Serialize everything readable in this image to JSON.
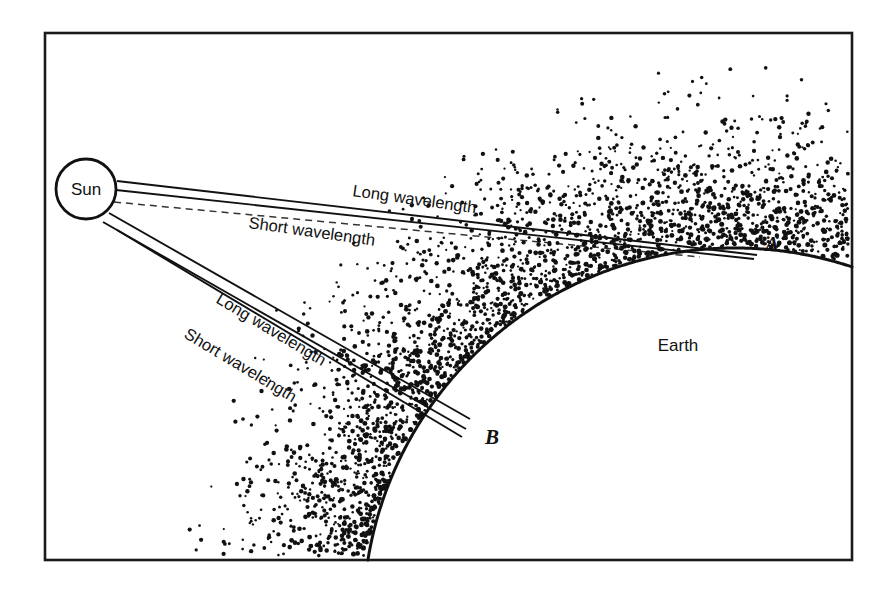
{
  "figure": {
    "name": "solar-radiation-atmosphere-diagram",
    "caption_visible": false,
    "background_color": "#ffffff",
    "ink_color": "#111111",
    "frame": {
      "x": 45,
      "y": 33,
      "width": 807,
      "height": 527
    }
  },
  "labels": {
    "sun": "Sun",
    "earth": "Earth",
    "point_a": "A",
    "point_b": "B",
    "upper_long": "Long wavelength",
    "upper_short": "Short wavelength",
    "lower_long": "Long wavelength",
    "lower_short": "Short wavelength"
  },
  "chart_data": {
    "type": "diagram",
    "title": "",
    "subtitle": "",
    "xlabel": "",
    "ylabel": "",
    "grid": false,
    "legend": "none",
    "bodies": [
      {
        "name": "sun",
        "shape": "circle",
        "label": "Sun",
        "cx": 86,
        "cy": 189,
        "r": 30
      },
      {
        "name": "earth",
        "shape": "arc",
        "label": "Earth",
        "cx": 735,
        "cy": 620,
        "r": 372,
        "label_x": 678,
        "label_y": 351
      }
    ],
    "points": [
      {
        "id": "A",
        "label": "A",
        "x": 760,
        "y": 258,
        "label_x": 772,
        "label_y": 251
      },
      {
        "id": "B",
        "label": "B",
        "x": 474,
        "y": 424,
        "label_x": 492,
        "label_y": 444
      }
    ],
    "ray_bundles": [
      {
        "name": "upper-bundle-to-A",
        "target_point": "A",
        "angle_deg": 8.5,
        "labels": [
          {
            "text": "Long wavelength",
            "x": 352,
            "y": 196,
            "rotate_deg": 8.0
          },
          {
            "text": "Short wavelength",
            "x": 248,
            "y": 228,
            "rotate_deg": 8.0
          }
        ],
        "lines": [
          {
            "x1": 117,
            "y1": 181,
            "x2": 757,
            "y2": 255,
            "style": "solid"
          },
          {
            "x1": 116,
            "y1": 190,
            "x2": 754,
            "y2": 259,
            "style": "solid"
          },
          {
            "x1": 114,
            "y1": 202,
            "x2": 700,
            "y2": 257,
            "style": "dashed"
          }
        ]
      },
      {
        "name": "lower-bundle-to-B",
        "target_point": "B",
        "angle_deg": 31.0,
        "labels": [
          {
            "text": "Long wavelength",
            "x": 215,
            "y": 302,
            "rotate_deg": 31.0
          },
          {
            "text": "Short wavelength",
            "x": 183,
            "y": 337,
            "rotate_deg": 31.0
          }
        ],
        "lines": [
          {
            "x1": 109,
            "y1": 213,
            "x2": 470,
            "y2": 419,
            "style": "solid"
          },
          {
            "x1": 103,
            "y1": 222,
            "x2": 466,
            "y2": 429,
            "style": "solid"
          },
          {
            "x1": 117,
            "y1": 230,
            "x2": 462,
            "y2": 437,
            "style": "solid"
          }
        ]
      }
    ],
    "atmosphere": {
      "representation": "stipple",
      "note": "Dot density increases toward the Earth surface and fades away from it.",
      "dot_radius_range": [
        1.1,
        2.6
      ],
      "band_thickness": 200
    }
  }
}
